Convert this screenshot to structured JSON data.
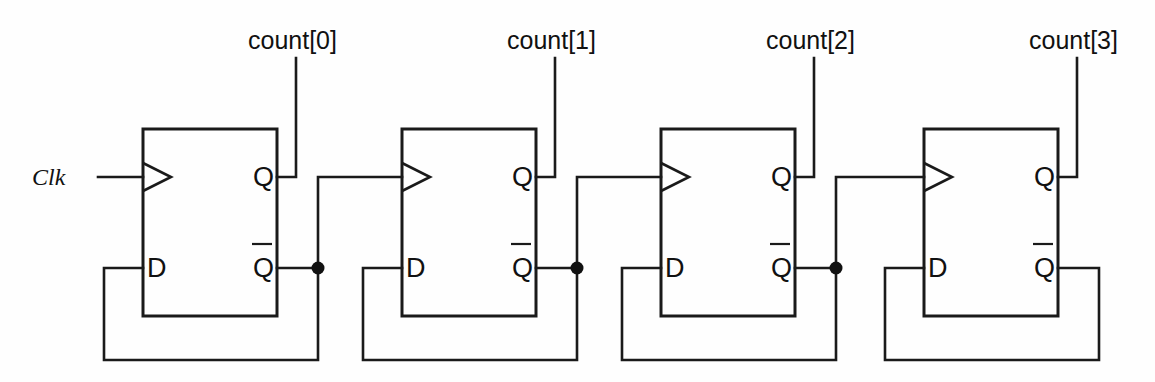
{
  "diagram": {
    "background_color": "#fefefe",
    "line_color": "#1a1a1a",
    "input": {
      "label": "Clk"
    },
    "stages": [
      {
        "index": 0,
        "output_label": "count[0]",
        "clock_pin": "",
        "d_pin": "D",
        "q_pin": "Q",
        "qbar_pin": "Q",
        "has_junction": true
      },
      {
        "index": 1,
        "output_label": "count[1]",
        "clock_pin": "",
        "d_pin": "D",
        "q_pin": "Q",
        "qbar_pin": "Q",
        "has_junction": true
      },
      {
        "index": 2,
        "output_label": "count[2]",
        "clock_pin": "",
        "d_pin": "D",
        "q_pin": "Q",
        "qbar_pin": "Q",
        "has_junction": true
      },
      {
        "index": 3,
        "output_label": "count[3]",
        "clock_pin": "",
        "d_pin": "D",
        "q_pin": "Q",
        "qbar_pin": "Q",
        "has_junction": false
      }
    ]
  }
}
